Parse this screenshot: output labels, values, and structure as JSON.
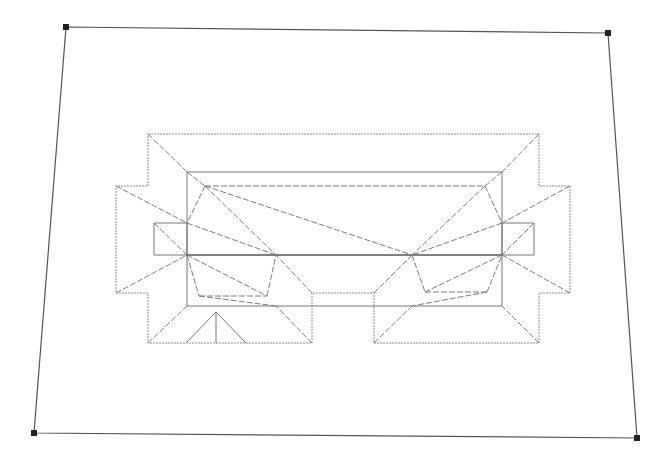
{
  "diagram": {
    "type": "roof-plan",
    "colors": {
      "background": "#ffffff",
      "lot_line": "#555555",
      "roof_line": "#8a8a8a",
      "corner_marker": "#222222"
    },
    "lot_corners": [
      [
        66,
        27
      ],
      [
        608,
        33
      ],
      [
        637,
        438
      ],
      [
        34,
        433
      ]
    ],
    "outer_outline": [
      [
        148,
        134
      ],
      [
        539,
        134
      ],
      [
        539,
        186
      ],
      [
        570,
        186
      ],
      [
        570,
        293
      ],
      [
        539,
        293
      ],
      [
        539,
        343
      ],
      [
        374,
        343
      ],
      [
        374,
        293
      ],
      [
        312,
        293
      ],
      [
        312,
        343
      ],
      [
        148,
        343
      ],
      [
        148,
        293
      ],
      [
        116,
        293
      ],
      [
        116,
        186
      ],
      [
        148,
        186
      ],
      [
        148,
        134
      ]
    ],
    "inner_rect": [
      [
        187,
        172
      ],
      [
        502,
        172
      ],
      [
        502,
        306
      ],
      [
        187,
        306
      ]
    ],
    "left_bay": [
      [
        154,
        223
      ],
      [
        187,
        223
      ],
      [
        187,
        255
      ],
      [
        154,
        255
      ]
    ],
    "right_bay": [
      [
        502,
        223
      ],
      [
        534,
        223
      ],
      [
        534,
        255
      ],
      [
        502,
        255
      ]
    ],
    "mid_line": [
      [
        187,
        255
      ],
      [
        502,
        255
      ]
    ],
    "hip_lines": [
      [
        [
          148,
          134
        ],
        [
          187,
          172
        ]
      ],
      [
        [
          539,
          134
        ],
        [
          502,
          172
        ]
      ],
      [
        [
          116,
          186
        ],
        [
          187,
          223
        ]
      ],
      [
        [
          570,
          186
        ],
        [
          502,
          223
        ]
      ],
      [
        [
          116,
          293
        ],
        [
          187,
          255
        ]
      ],
      [
        [
          570,
          293
        ],
        [
          502,
          255
        ]
      ],
      [
        [
          148,
          343
        ],
        [
          187,
          306
        ]
      ],
      [
        [
          312,
          343
        ],
        [
          276,
          306
        ]
      ],
      [
        [
          374,
          343
        ],
        [
          412,
          306
        ]
      ],
      [
        [
          539,
          343
        ],
        [
          502,
          306
        ]
      ],
      [
        [
          154,
          223
        ],
        [
          187,
          255
        ]
      ],
      [
        [
          534,
          223
        ],
        [
          502,
          255
        ]
      ],
      [
        [
          312,
          293
        ],
        [
          276,
          255
        ]
      ],
      [
        [
          374,
          293
        ],
        [
          412,
          255
        ]
      ]
    ],
    "ridge_lines": [
      [
        [
          187,
          172
        ],
        [
          205,
          186
        ]
      ],
      [
        [
          205,
          186
        ],
        [
          485,
          186
        ]
      ],
      [
        [
          485,
          186
        ],
        [
          502,
          172
        ]
      ],
      [
        [
          205,
          186
        ],
        [
          187,
          223
        ]
      ],
      [
        [
          485,
          186
        ],
        [
          502,
          223
        ]
      ],
      [
        [
          205,
          186
        ],
        [
          276,
          255
        ]
      ],
      [
        [
          205,
          186
        ],
        [
          412,
          255
        ]
      ],
      [
        [
          187,
          223
        ],
        [
          276,
          255
        ]
      ],
      [
        [
          502,
          223
        ],
        [
          412,
          255
        ]
      ],
      [
        [
          485,
          186
        ],
        [
          412,
          255
        ]
      ],
      [
        [
          187,
          255
        ],
        [
          199,
          296
        ]
      ],
      [
        [
          199,
          296
        ],
        [
          267,
          296
        ]
      ],
      [
        [
          267,
          296
        ],
        [
          276,
          255
        ]
      ],
      [
        [
          187,
          255
        ],
        [
          267,
          296
        ]
      ],
      [
        [
          199,
          296
        ],
        [
          276,
          306
        ]
      ],
      [
        [
          412,
          255
        ],
        [
          425,
          292
        ]
      ],
      [
        [
          425,
          292
        ],
        [
          487,
          292
        ]
      ],
      [
        [
          487,
          292
        ],
        [
          502,
          255
        ]
      ],
      [
        [
          502,
          255
        ],
        [
          425,
          292
        ]
      ],
      [
        [
          487,
          292
        ],
        [
          412,
          306
        ]
      ]
    ],
    "gable_lines": [
      [
        [
          186,
          343
        ],
        [
          216,
          312
        ]
      ],
      [
        [
          216,
          312
        ],
        [
          246,
          343
        ]
      ],
      [
        [
          216,
          312
        ],
        [
          216,
          343
        ]
      ]
    ]
  }
}
